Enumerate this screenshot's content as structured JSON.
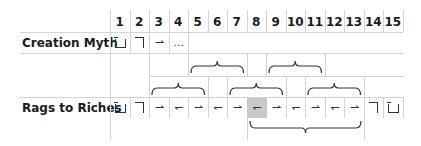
{
  "columns": [
    "1",
    "2",
    "3",
    "4",
    "5",
    "6",
    "7",
    "8",
    "9",
    "10",
    "11",
    "12",
    "13",
    "14",
    "15"
  ],
  "rows": [
    {
      "label": "Creation Myth",
      "cells": [
        {
          "col": 1,
          "symbol": "box-open",
          "glyph": ""
        },
        {
          "col": 2,
          "symbol": "corner",
          "glyph": ""
        },
        {
          "col": 3,
          "symbol": "right-arrow",
          "glyph": "⇀"
        },
        {
          "col": 4,
          "symbol": "ellipsis",
          "glyph": "…"
        }
      ]
    },
    {
      "label": "Rags to Riches",
      "cells": [
        {
          "col": 1,
          "symbol": "box-open",
          "glyph": ""
        },
        {
          "col": 2,
          "symbol": "corner",
          "glyph": ""
        },
        {
          "col": 3,
          "symbol": "right-arrow",
          "glyph": "⇀"
        },
        {
          "col": 4,
          "symbol": "left-arrow",
          "glyph": "↽"
        },
        {
          "col": 5,
          "symbol": "right-arrow",
          "glyph": "⇀"
        },
        {
          "col": 6,
          "symbol": "left-arrow",
          "glyph": "↽"
        },
        {
          "col": 7,
          "symbol": "right-arrow",
          "glyph": "⇀"
        },
        {
          "col": 8,
          "symbol": "left-arrow",
          "glyph": "↽",
          "highlighted": true
        },
        {
          "col": 9,
          "symbol": "right-arrow",
          "glyph": "⇀"
        },
        {
          "col": 10,
          "symbol": "left-arrow",
          "glyph": "↽"
        },
        {
          "col": 11,
          "symbol": "right-arrow",
          "glyph": "⇀"
        },
        {
          "col": 12,
          "symbol": "left-arrow",
          "glyph": "↽"
        },
        {
          "col": 13,
          "symbol": "right-arrow",
          "glyph": "⇀"
        },
        {
          "col": 14,
          "symbol": "corner",
          "glyph": ""
        },
        {
          "col": 15,
          "symbol": "box-open",
          "glyph": ""
        }
      ]
    }
  ],
  "braces": [
    {
      "row": "upper-1",
      "from_col": 5,
      "to_col": 7
    },
    {
      "row": "upper-1",
      "from_col": 9,
      "to_col": 11
    },
    {
      "row": "upper-2",
      "from_col": 3,
      "to_col": 5
    },
    {
      "row": "upper-2",
      "from_col": 7,
      "to_col": 9
    },
    {
      "row": "upper-2",
      "from_col": 11,
      "to_col": 13
    },
    {
      "row": "lower",
      "from_col": 8,
      "to_col": 13
    }
  ],
  "colors": {
    "grid": "#d4d4d4",
    "highlight": "#c8c8c8",
    "text": "#1a1a1a"
  }
}
